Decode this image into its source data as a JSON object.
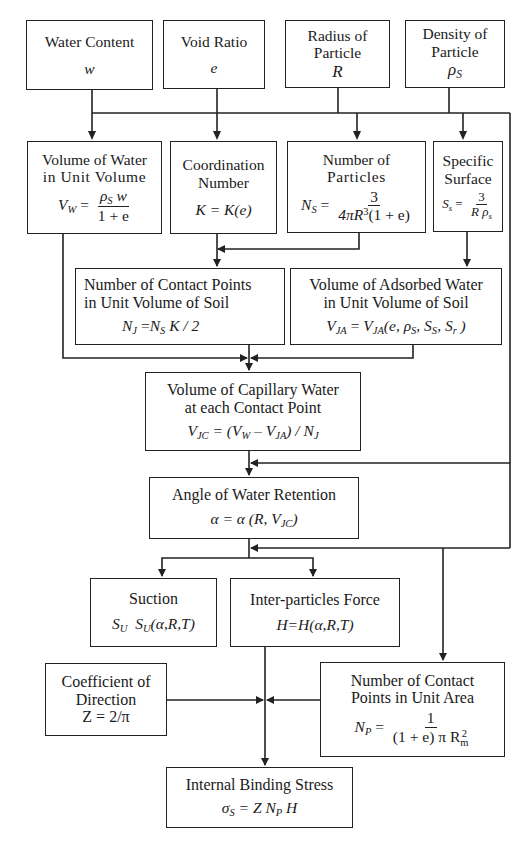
{
  "diagram": {
    "type": "flowchart",
    "inputs": [
      {
        "id": "water-content",
        "title": "Water Content",
        "symbol": "w"
      },
      {
        "id": "void-ratio",
        "title": "Void Ratio",
        "symbol": "e"
      },
      {
        "id": "radius-of-particle",
        "title_line1": "Radius of",
        "title_line2": "Particle",
        "symbol": "R"
      },
      {
        "id": "density-of-particle",
        "title_line1": "Density of",
        "title_line2": "Particle",
        "symbol": "ρ",
        "symbol_sub": "S"
      }
    ],
    "derived": {
      "volume_of_water": {
        "line1": "Volume of Water",
        "line2": "in Unit Volume",
        "lhs": "V",
        "lhs_sub": "W",
        "eq": " = ",
        "num": "ρ",
        "num_sub": "S",
        "num_tail": " w",
        "den": "1 + e"
      },
      "coordination_number": {
        "line1": "Coordination",
        "line2": "Number",
        "formula": "K = K(e)"
      },
      "number_of_particles": {
        "line1": "Number of",
        "line2": "Particles",
        "lhs": "N",
        "lhs_sub": "S",
        "eq": " = ",
        "num": "3",
        "den_a": "4πR",
        "den_sup": "3",
        "den_b": "(1 + e)"
      },
      "specific_surface": {
        "line1": "Specific",
        "line2": "Surface",
        "lhs": "S",
        "lhs_sub": "s",
        "eq": " = ",
        "num": "3",
        "den_a": "R ρ",
        "den_sub": "s"
      },
      "contact_points_volume": {
        "line1": "Number of Contact Points",
        "line2": "in Unit Volume of Soil",
        "lhs": "N",
        "lhs_sub": "J",
        "eq": " =",
        "rhs_a": "N",
        "rhs_sub": "S",
        "rhs_b": " K / 2"
      },
      "adsorbed_water": {
        "line1": "Volume of Adsorbed Water",
        "line2": "in Unit Volume of Soil",
        "lhs": "V",
        "lhs_sub": "JA",
        "eq": " = ",
        "rhs": "V",
        "rhs_sub": "JA",
        "args": "(e, ρ",
        "args_sub1": "S",
        "args_mid": ", S",
        "args_sub2": "S",
        "args_mid2": ", S",
        "args_sub3": "r",
        "args_end": " )"
      },
      "capillary_water": {
        "line1": "Volume of Capillary Water",
        "line2": "at each Contact Point",
        "lhs": "V",
        "lhs_sub": "JC",
        "eq": " = (V",
        "s1": "W",
        "m1": " – V",
        "s2": "JA",
        "m2": ") / N",
        "s3": "J"
      },
      "angle_of_retention": {
        "line1": "Angle of Water Retention",
        "formula_a": "α = α (R, V",
        "formula_sub": "JC",
        "formula_end": ")"
      },
      "suction": {
        "line1": "Suction",
        "a": "S",
        "a_sub": "U",
        "b": "  S",
        "b_sub": "U",
        "c": "(α,R,T)"
      },
      "inter_particles_force": {
        "line1": "Inter-particles Force",
        "formula": "H=H(α,R,T)"
      },
      "coefficient_of_direction": {
        "line1": "Coefficient of",
        "line2": "Direction",
        "formula": "Z = 2/π"
      },
      "contact_points_area": {
        "line1": "Number of Contact",
        "line2": "Points in Unit Area",
        "lhs": "N",
        "lhs_sub": "P",
        "eq": " = ",
        "num": "1",
        "den_a": "(1 + e) π R",
        "den_sup": "2",
        "den_sub": "m"
      },
      "internal_binding_stress": {
        "line1": "Internal Binding Stress",
        "lhs": "σ",
        "lhs_sub": "S",
        "eq": " = Z N",
        "s1": "P",
        "end": " H"
      }
    }
  }
}
